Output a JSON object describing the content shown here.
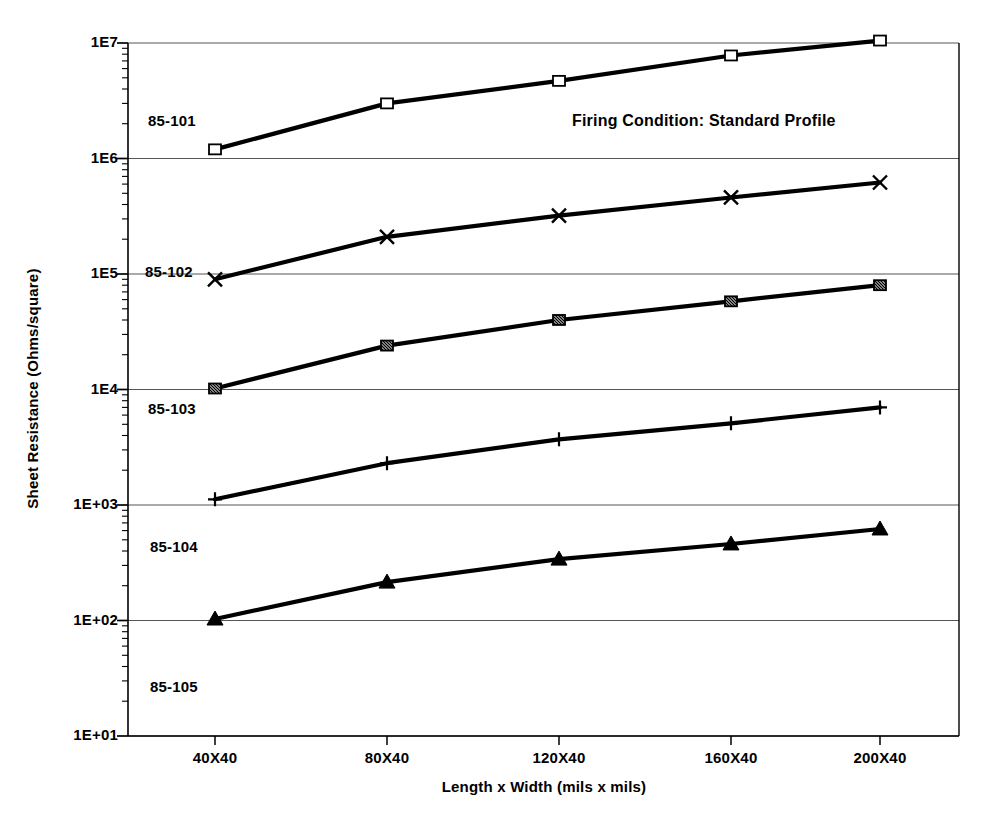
{
  "chart_data": {
    "type": "line",
    "title": "",
    "annotation": "Firing Condition: Standard Profile",
    "xlabel": "Length x Width  (mils x mils)",
    "ylabel": "Sheet Resistance  (Ohms/square)",
    "yscale": "log",
    "ylim": [
      10,
      10000000
    ],
    "grid": true,
    "legend_position": "inline-left-labels",
    "categories": [
      "40X40",
      "80X40",
      "120X40",
      "160X40",
      "200X40"
    ],
    "ytick_labels": [
      "1E7",
      "1E6",
      "1E5",
      "1E4",
      "1E+03",
      "1E+02",
      "1E+01"
    ],
    "ytick_values": [
      10000000,
      1000000,
      100000,
      10000,
      1000,
      100,
      10
    ],
    "series": [
      {
        "name": "85-105",
        "marker": "open-square",
        "values": [
          1200000,
          3000000,
          4700000,
          7800000,
          10500000
        ]
      },
      {
        "name": "85-104",
        "marker": "x-cross",
        "values": [
          90000,
          210000,
          320000,
          460000,
          620000
        ]
      },
      {
        "name": "85-103",
        "marker": "hatched-square",
        "values": [
          10200,
          24000,
          40000,
          58000,
          80000
        ]
      },
      {
        "name": "85-102",
        "marker": "plus",
        "values": [
          1120,
          2300,
          3700,
          5100,
          7000
        ]
      },
      {
        "name": "85-101",
        "marker": "filled-triangle",
        "values": [
          103,
          215,
          340,
          460,
          620
        ]
      }
    ],
    "colors": {
      "line": "#000000",
      "grid": "#555555",
      "axis": "#000000",
      "background": "#ffffff"
    }
  }
}
